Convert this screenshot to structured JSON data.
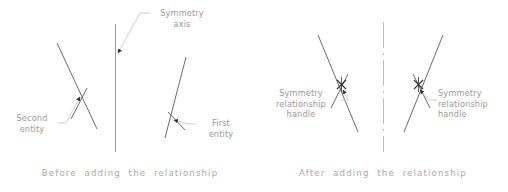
{
  "figure": {
    "width": 508,
    "height": 192,
    "background": "#ffffff",
    "line_color": "#595959",
    "axis_color": "#8c8c8c",
    "leader_color": "#c9c9c9",
    "text_color": "#9a9a9a",
    "caption_color": "#a8a8a8",
    "handle_color": "#333333"
  },
  "panels": {
    "before": {
      "caption": "Before  adding  the  relationship",
      "labels": {
        "symmetry_axis": "Symmetry\naxis",
        "second_entity": "Second\nentity",
        "first_entity": "First\nentity"
      },
      "axis_style": "solid"
    },
    "after": {
      "caption": "After  adding  the  relationship",
      "labels": {
        "handle_left": "Symmetry\nrelationship\nhandle",
        "handle_right": "Symmetry\nrelationship\nhandle"
      },
      "axis_style": "dash-dot"
    }
  },
  "icons": {
    "handle": "symmetry-handle-x-marker",
    "arrow": "leader-arrowhead"
  }
}
